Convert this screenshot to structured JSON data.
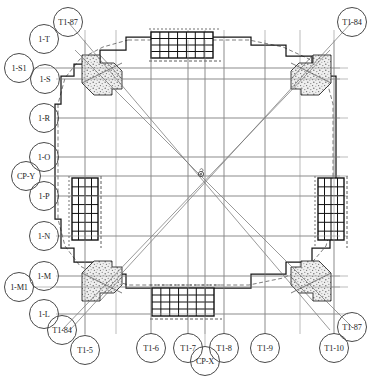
{
  "drawing": {
    "title": "Structural Foundation Plan — Grid / Axis Layout",
    "type": "architectural-plan",
    "canvas": {
      "width": 376,
      "height": 381
    },
    "colors": {
      "background": "#ffffff",
      "gridline": "#8d8d8d",
      "outline": "#1a1a1a",
      "diagonal": "#6f6f6f",
      "rebar": "#111111",
      "concrete_fill": "#e8e8e8",
      "bubble_stroke": "#4a4a4a",
      "dashed_inner": "#5a5a5a"
    },
    "center_mark": {
      "label": "",
      "x": 201,
      "y": 174
    }
  },
  "grid_bubbles_left": [
    {
      "label": "1-T",
      "cx": 44,
      "cy": 39,
      "r": 15,
      "leader_to_x": 0,
      "leader_y": 0,
      "has_leader": false
    },
    {
      "label": "1-S1",
      "cx": 19,
      "cy": 68,
      "r": 15,
      "leader_to_x": 340,
      "leader_y": 68,
      "has_leader": true
    },
    {
      "label": "1-S",
      "cx": 45,
      "cy": 79,
      "r": 15,
      "leader_to_x": 340,
      "leader_y": 79,
      "has_leader": true
    },
    {
      "label": "1-R",
      "cx": 44,
      "cy": 118,
      "r": 15,
      "leader_to_x": 340,
      "leader_y": 118,
      "has_leader": true
    },
    {
      "label": "1-O",
      "cx": 44,
      "cy": 157,
      "r": 15,
      "leader_to_x": 340,
      "leader_y": 157,
      "has_leader": true
    },
    {
      "label": "CP-Y",
      "cx": 26,
      "cy": 176,
      "r": 15,
      "leader_to_x": 340,
      "leader_y": 176,
      "has_leader": true
    },
    {
      "label": "1-P",
      "cx": 44,
      "cy": 196,
      "r": 15,
      "leader_to_x": 340,
      "leader_y": 196,
      "has_leader": true
    },
    {
      "label": "1-N",
      "cx": 44,
      "cy": 236,
      "r": 15,
      "leader_to_x": 340,
      "leader_y": 236,
      "has_leader": true
    },
    {
      "label": "1-M",
      "cx": 44,
      "cy": 276,
      "r": 15,
      "leader_to_x": 340,
      "leader_y": 276,
      "has_leader": true
    },
    {
      "label": "1-M1",
      "cx": 19,
      "cy": 287,
      "r": 15,
      "leader_to_x": 340,
      "leader_y": 287,
      "has_leader": true
    },
    {
      "label": "1-L",
      "cx": 44,
      "cy": 314,
      "r": 15,
      "leader_to_x": 340,
      "leader_y": 314,
      "has_leader": true
    }
  ],
  "grid_bubbles_bottom": [
    {
      "label": "T1-5",
      "cx": 85,
      "cy": 350,
      "r": 15,
      "leader_x": 85,
      "leader_to_y": 40,
      "has_leader": true
    },
    {
      "label": "T1-6",
      "cx": 151,
      "cy": 348,
      "r": 15,
      "leader_x": 151,
      "leader_to_y": 40,
      "has_leader": true
    },
    {
      "label": "T1-7",
      "cx": 188,
      "cy": 348,
      "r": 15,
      "leader_x": 188,
      "leader_to_y": 40,
      "has_leader": true
    },
    {
      "label": "CP-X",
      "cx": 205,
      "cy": 361,
      "r": 15,
      "leader_x": 205,
      "leader_to_y": 40,
      "has_leader": true
    },
    {
      "label": "T1-8",
      "cx": 224,
      "cy": 348,
      "r": 15,
      "leader_x": 224,
      "leader_to_y": 40,
      "has_leader": true
    },
    {
      "label": "T1-9",
      "cx": 265,
      "cy": 348,
      "r": 15,
      "leader_x": 265,
      "leader_to_y": 40,
      "has_leader": true
    },
    {
      "label": "T1-10",
      "cx": 334,
      "cy": 348,
      "r": 15,
      "leader_x": 334,
      "leader_to_y": 40,
      "has_leader": true
    }
  ],
  "diagonal_bubbles": [
    {
      "label": "T1-87",
      "cx": 68,
      "cy": 22,
      "r": 15,
      "to_x": 330,
      "to_y": 330
    },
    {
      "label": "T1-84",
      "cx": 352,
      "cy": 22,
      "r": 15,
      "to_x": 70,
      "to_y": 330
    },
    {
      "label": "T1-84",
      "cx": 62,
      "cy": 330,
      "r": 15,
      "to_x": 330,
      "to_y": 50
    },
    {
      "label": "T1-87",
      "cx": 352,
      "cy": 327,
      "r": 15,
      "to_x": 75,
      "to_y": 50
    }
  ],
  "vertical_gridlines_x": [
    85,
    116,
    151,
    188,
    205,
    224,
    265,
    300,
    334
  ],
  "horizontal_gridlines_y": [
    68,
    79,
    118,
    157,
    176,
    196,
    236,
    276,
    287,
    314
  ],
  "rebar_blocks": [
    {
      "name": "rebar-block-top",
      "x": 151,
      "y": 32,
      "w": 62,
      "h": 26,
      "orient": "horizontal",
      "cols": 7,
      "rows": 4
    },
    {
      "name": "rebar-block-bottom",
      "x": 152,
      "y": 288,
      "w": 62,
      "h": 28,
      "orient": "horizontal",
      "cols": 7,
      "rows": 4
    },
    {
      "name": "rebar-block-left",
      "x": 72,
      "y": 178,
      "w": 26,
      "h": 62,
      "orient": "vertical",
      "cols": 4,
      "rows": 7
    },
    {
      "name": "rebar-block-right",
      "x": 318,
      "y": 178,
      "w": 26,
      "h": 62,
      "orient": "vertical",
      "cols": 4,
      "rows": 7
    }
  ],
  "corner_blocks": [
    {
      "name": "corner-top-left",
      "cx": 104,
      "cy": 75
    },
    {
      "name": "corner-top-right",
      "cx": 309,
      "cy": 75
    },
    {
      "name": "corner-bottom-left",
      "cx": 104,
      "cy": 281
    },
    {
      "name": "corner-bottom-right",
      "cx": 309,
      "cy": 281
    }
  ],
  "notes": {
    "plan_outline": "rounded-square slab with chamfered stippled corner pads",
    "center_symbol": "axis intersection marker at plan centroid"
  }
}
